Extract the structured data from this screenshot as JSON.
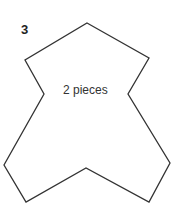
{
  "figure": {
    "number": "3",
    "label": "2 pieces",
    "stroke_color": "#333333",
    "shape_vertices": [
      [
        87,
        23
      ],
      [
        149,
        58
      ],
      [
        128,
        94
      ],
      [
        170,
        163
      ],
      [
        149,
        202
      ],
      [
        86,
        168
      ],
      [
        26,
        202
      ],
      [
        4,
        165
      ],
      [
        44,
        94
      ],
      [
        25,
        60
      ]
    ]
  }
}
